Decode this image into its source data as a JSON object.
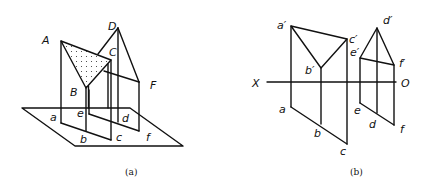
{
  "figure_a": {
    "caption": "(a)",
    "labels": {
      "A": "A",
      "B": "B",
      "C": "C",
      "D": "D",
      "F": "F",
      "a": "a",
      "b": "b",
      "c": "c",
      "d": "d",
      "e": "e",
      "f": "f"
    },
    "description": "Pictorial view of two triangles ABC (shaded) and DEF above the horizontal projection plane with projectors down to a, b, c, d, e, f"
  },
  "figure_b": {
    "caption": "(b)",
    "axis": {
      "left": "X",
      "right": "O"
    },
    "labels": {
      "a_prime": "a′",
      "b_prime": "b′",
      "c_prime": "c′",
      "d_prime": "d′",
      "e_prime": "e′",
      "f_prime": "f′",
      "a": "a",
      "b": "b",
      "c": "c",
      "d": "d",
      "e": "e",
      "f": "f"
    },
    "description": "Orthographic projections (front view above X–O, top view below) of triangles ABC and DEF"
  },
  "colors": {
    "line": "#111111",
    "background": "#ffffff"
  }
}
